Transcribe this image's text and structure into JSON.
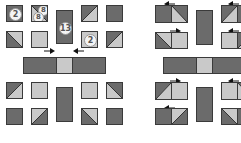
{
  "colors": {
    "dark": "#6b6b6b",
    "light": "#c9c9c9",
    "outline": "#3a3a3a",
    "badge_bg": "#f4f4f4"
  },
  "left_panel": {
    "badges": {
      "square_a": "2",
      "hst_a1": "8",
      "hst_a2": "8",
      "center_rect": "13",
      "light_square": "2"
    },
    "arrows": [
      "arrow-right",
      "arrow-left"
    ]
  },
  "right_panel": {
    "arrows": [
      "arrow-left",
      "arrow-right",
      "arrow-left",
      "arrow-right",
      "arrow-left",
      "arrow-left"
    ]
  }
}
